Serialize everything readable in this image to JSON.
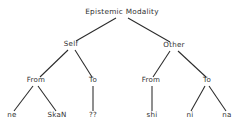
{
  "figure": {
    "kind": "syntax-tree-diagram",
    "background_color": "#ffffff",
    "line_color": "#2a2a2a",
    "text_color": "#303030",
    "width": 245,
    "height": 124
  },
  "tree": {
    "nodes": [
      {
        "id": "root",
        "label": "Epistemic Modality",
        "x": 122,
        "y": 14,
        "level": 0,
        "type": "root"
      },
      {
        "id": "self",
        "label": "Self",
        "x": 71,
        "y": 46,
        "level": 1,
        "type": "branch"
      },
      {
        "id": "other",
        "label": "Other",
        "x": 174,
        "y": 47,
        "level": 1,
        "type": "branch"
      },
      {
        "id": "self-from",
        "label": "From",
        "x": 36,
        "y": 82,
        "level": 2,
        "type": "branch"
      },
      {
        "id": "self-to",
        "label": "To",
        "x": 93,
        "y": 82,
        "level": 2,
        "type": "branch"
      },
      {
        "id": "other-from",
        "label": "From",
        "x": 151,
        "y": 82,
        "level": 2,
        "type": "branch"
      },
      {
        "id": "other-to",
        "label": "To",
        "x": 207,
        "y": 82,
        "level": 2,
        "type": "branch"
      },
      {
        "id": "leaf-ne",
        "label": "ne",
        "x": 12,
        "y": 117,
        "level": 3,
        "type": "leaf"
      },
      {
        "id": "leaf-skan",
        "label": "SkaN",
        "x": 57,
        "y": 117,
        "level": 3,
        "type": "leaf"
      },
      {
        "id": "leaf-qq",
        "label": "??",
        "x": 93,
        "y": 117,
        "level": 3,
        "type": "leaf"
      },
      {
        "id": "leaf-shi",
        "label": "shi",
        "x": 152,
        "y": 117,
        "level": 3,
        "type": "leaf"
      },
      {
        "id": "leaf-ni",
        "label": "ni",
        "x": 190,
        "y": 117,
        "level": 3,
        "type": "leaf"
      },
      {
        "id": "leaf-na",
        "label": "na",
        "x": 227,
        "y": 117,
        "level": 3,
        "type": "leaf"
      }
    ],
    "edges": [
      {
        "id": "e-root-self",
        "from": "root",
        "to": "self",
        "x1": 116,
        "y1": 18,
        "x2": 76,
        "y2": 41
      },
      {
        "id": "e-root-other",
        "from": "root",
        "to": "other",
        "x1": 128,
        "y1": 18,
        "x2": 170,
        "y2": 42
      },
      {
        "id": "e-self-from",
        "from": "self",
        "to": "self-from",
        "x1": 68,
        "y1": 50,
        "x2": 40,
        "y2": 77
      },
      {
        "id": "e-self-to",
        "from": "self",
        "to": "self-to",
        "x1": 75,
        "y1": 50,
        "x2": 92,
        "y2": 77
      },
      {
        "id": "e-other-from",
        "from": "other",
        "to": "other-from",
        "x1": 170,
        "y1": 51,
        "x2": 153,
        "y2": 77
      },
      {
        "id": "e-other-to",
        "from": "other",
        "to": "other-to",
        "x1": 178,
        "y1": 51,
        "x2": 206,
        "y2": 77
      },
      {
        "id": "e-selffrom-ne",
        "from": "self-from",
        "to": "leaf-ne",
        "x1": 33,
        "y1": 86,
        "x2": 14,
        "y2": 111
      },
      {
        "id": "e-selffrom-skan",
        "from": "self-from",
        "to": "leaf-skan",
        "x1": 38,
        "y1": 86,
        "x2": 56,
        "y2": 111
      },
      {
        "id": "e-selfto-qq",
        "from": "self-to",
        "to": "leaf-qq",
        "x1": 93,
        "y1": 86,
        "x2": 93,
        "y2": 111
      },
      {
        "id": "e-otherfrom-shi",
        "from": "other-from",
        "to": "leaf-shi",
        "x1": 152,
        "y1": 86,
        "x2": 152,
        "y2": 111
      },
      {
        "id": "e-otherto-ni",
        "from": "other-to",
        "to": "leaf-ni",
        "x1": 205,
        "y1": 86,
        "x2": 191,
        "y2": 111
      },
      {
        "id": "e-otherto-na",
        "from": "other-to",
        "to": "leaf-na",
        "x1": 209,
        "y1": 86,
        "x2": 226,
        "y2": 111
      }
    ]
  }
}
